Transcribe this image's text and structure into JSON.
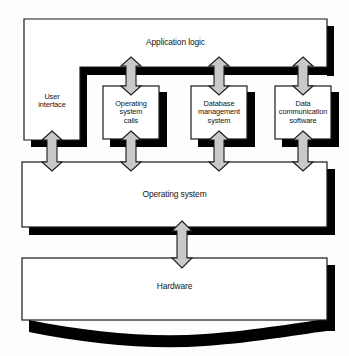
{
  "diagram": {
    "colors": {
      "box_fill": "#ffffff",
      "box_stroke": "#1a1a1a",
      "shadow": "#000000",
      "arrow_fill": "#c9c9c9",
      "arrow_stroke": "#1a1a1a",
      "text": "#141414",
      "background": "#fdfdfd"
    },
    "layers": [
      {
        "id": "application-logic",
        "label": "Application logic",
        "level": "top"
      },
      {
        "id": "user-interface",
        "label": "User\ninterface",
        "level": "middle"
      },
      {
        "id": "operating-system-calls",
        "label": "Operating\nsystem\ncalls",
        "level": "middle"
      },
      {
        "id": "database-management-system",
        "label": "Database\nmanagement\nsystem",
        "level": "middle"
      },
      {
        "id": "data-communication-software",
        "label": "Data\ncommunication\nsoftware",
        "level": "middle"
      },
      {
        "id": "operating-system",
        "label": "Operating system",
        "level": "lower"
      },
      {
        "id": "hardware",
        "label": "Hardware",
        "level": "bottom"
      }
    ],
    "connectors": [
      {
        "id": "app-to-os-calls",
        "from": "application-logic",
        "to": "operating-system-calls",
        "style": "double-arrow-vertical"
      },
      {
        "id": "app-to-dbms",
        "from": "application-logic",
        "to": "database-management-system",
        "style": "double-arrow-vertical"
      },
      {
        "id": "app-to-datacomm",
        "from": "application-logic",
        "to": "data-communication-software",
        "style": "double-arrow-vertical"
      },
      {
        "id": "ui-to-os",
        "from": "user-interface",
        "to": "operating-system",
        "style": "double-arrow-vertical"
      },
      {
        "id": "os-calls-to-os",
        "from": "operating-system-calls",
        "to": "operating-system",
        "style": "double-arrow-vertical"
      },
      {
        "id": "dbms-to-os",
        "from": "database-management-system",
        "to": "operating-system",
        "style": "double-arrow-vertical"
      },
      {
        "id": "datacomm-to-os",
        "from": "data-communication-software",
        "to": "operating-system",
        "style": "double-arrow-vertical"
      },
      {
        "id": "os-to-hardware",
        "from": "operating-system",
        "to": "hardware",
        "style": "double-arrow-vertical"
      }
    ]
  }
}
